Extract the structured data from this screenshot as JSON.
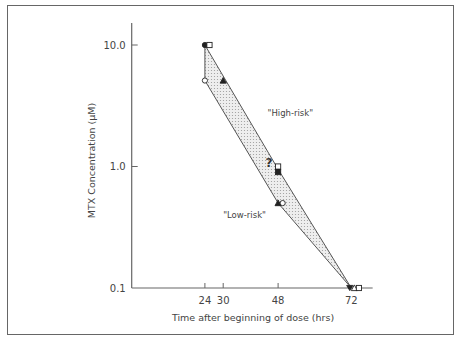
{
  "chart_data": {
    "type": "line",
    "title": "",
    "xlabel": "Time after beginning of dose (hrs)",
    "ylabel": "MTX Concentration (μM)",
    "yscale": "log",
    "ylim": [
      0.1,
      10.0
    ],
    "xlim": [
      0,
      79
    ],
    "x_ticks": [
      24,
      30,
      48,
      72
    ],
    "x_tick_labels": [
      "24",
      "30",
      "48",
      "72"
    ],
    "y_ticks": [
      10.0,
      1.0,
      0.1
    ],
    "y_tick_labels": [
      "10.0",
      "1.0",
      "0.1"
    ],
    "grid": false,
    "legend": null,
    "band": {
      "description": "shaded intermediate zone between high-risk and low-risk boundaries",
      "upper_boundary": [
        {
          "x": 24,
          "y": 10.0
        },
        {
          "x": 48,
          "y": 0.95
        },
        {
          "x": 72,
          "y": 0.1
        }
      ],
      "lower_boundary": [
        {
          "x": 24,
          "y": 10.0
        },
        {
          "x": 24,
          "y": 5.1
        },
        {
          "x": 48,
          "y": 0.5
        },
        {
          "x": 72,
          "y": 0.1
        }
      ]
    },
    "points": [
      {
        "marker": "filled-circle",
        "x": 24,
        "y": 10.0
      },
      {
        "marker": "open-square",
        "x": 25.5,
        "y": 10.0
      },
      {
        "marker": "open-circle",
        "x": 24,
        "y": 5.1
      },
      {
        "marker": "filled-triangle",
        "x": 30,
        "y": 5.1
      },
      {
        "marker": "open-square",
        "x": 48,
        "y": 1.0
      },
      {
        "marker": "filled-square",
        "x": 48,
        "y": 0.9
      },
      {
        "marker": "filled-triangle",
        "x": 48,
        "y": 0.5
      },
      {
        "marker": "open-circle",
        "x": 49.5,
        "y": 0.5
      },
      {
        "marker": "filled-down-triangle",
        "x": 71.5,
        "y": 0.1
      },
      {
        "marker": "open-triangle",
        "x": 73,
        "y": 0.1
      },
      {
        "marker": "open-square",
        "x": 74.5,
        "y": 0.1
      }
    ],
    "annotations": [
      {
        "text": "\"High-risk\"",
        "x": 52,
        "y": 2.6
      },
      {
        "text": "\"Low-risk\"",
        "x": 37,
        "y": 0.38
      },
      {
        "text": "?",
        "x": 45,
        "y": 1.0
      }
    ]
  }
}
